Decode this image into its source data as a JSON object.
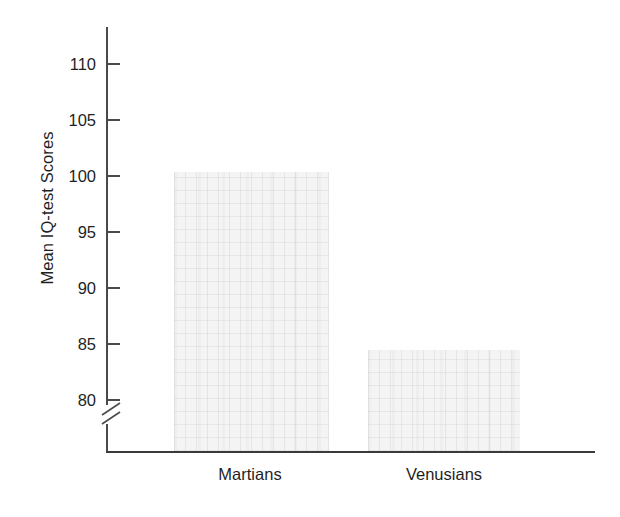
{
  "chart_data": {
    "type": "bar",
    "title": "",
    "subtitle": "",
    "xlabel": "",
    "ylabel": "Mean IQ-test Scores",
    "categories": [
      "Martians",
      "Venusians"
    ],
    "values": [
      100.4,
      84.5
    ],
    "series": [
      {
        "name": "Mean IQ-test Scores",
        "values": [
          100.4,
          84.5
        ]
      }
    ],
    "ylim": [
      77.5,
      112
    ],
    "y_ticks": [
      80,
      85,
      90,
      95,
      100,
      105,
      110
    ],
    "y_tick_labels": [
      "80",
      "85",
      "90",
      "95",
      "100",
      "105",
      "110"
    ],
    "y_axis_break": true,
    "y_axis_break_note": "axis break below 80",
    "grid": false,
    "legend": false,
    "legend_position": "none",
    "bar_fill_color": "#f4f4f4",
    "axis_color": "#4a4a4a",
    "text_color": "#1f1f1f",
    "background_color": "#ffffff"
  },
  "axis": {
    "y_title": "Mean IQ-test Scores",
    "ticks": [
      {
        "label": "110",
        "value": 110
      },
      {
        "label": "105",
        "value": 105
      },
      {
        "label": "100",
        "value": 100
      },
      {
        "label": "95",
        "value": 95
      },
      {
        "label": "90",
        "value": 90
      },
      {
        "label": "85",
        "value": 85
      },
      {
        "label": "80",
        "value": 80
      }
    ]
  },
  "bars": [
    {
      "label": "Martians",
      "value": 100.4
    },
    {
      "label": "Venusians",
      "value": 84.5
    }
  ]
}
